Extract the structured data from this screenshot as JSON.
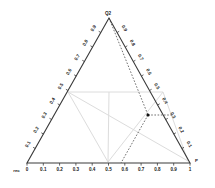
{
  "chart_data": {
    "type": "scatter",
    "plot_kind": "ternary-diagram",
    "title": "",
    "vertices": [
      {
        "id": "top",
        "label": "Q2",
        "x": 109,
        "y": 18
      },
      {
        "id": "left",
        "label": "rec",
        "x": 27,
        "y": 163
      },
      {
        "id": "right",
        "label": "P",
        "x": 190,
        "y": 163
      }
    ],
    "axes": {
      "bottom": {
        "name": "bottom-axis",
        "ticks": [
          "0",
          "0.1",
          "0.2",
          "0.3",
          "0.4",
          "0.5",
          "0.6",
          "0.7",
          "0.8",
          "0.9",
          "1"
        ],
        "label_rotation": 0,
        "range": [
          0,
          1
        ]
      },
      "left": {
        "name": "left-axis",
        "ticks": [
          "0.1",
          "0.2",
          "0.3",
          "0.4",
          "0.5",
          "0.6",
          "0.7",
          "0.8",
          "0.9"
        ],
        "label_rotation": -60,
        "range": [
          0,
          1
        ]
      },
      "right": {
        "name": "right-axis",
        "ticks": [
          "0.9",
          "0.8",
          "0.7",
          "0.6",
          "0.5",
          "0.4",
          "0.3",
          "0.2",
          "0.1"
        ],
        "label_rotation": 60,
        "range": [
          0,
          1
        ]
      }
    },
    "grid": false,
    "legend": null,
    "points": [
      {
        "name": "marked-point",
        "x": 148,
        "y": 115,
        "bottom_value": 0.74,
        "color": "#111111"
      }
    ],
    "guide_lines": [
      {
        "name": "guide-apex-to-point",
        "style": "dashed",
        "color": "#333333",
        "path": [
          [
            109,
            18
          ],
          [
            148,
            115
          ]
        ]
      },
      {
        "name": "guide-point-to-base",
        "style": "dashed",
        "color": "#333333",
        "path": [
          [
            148,
            115
          ],
          [
            121,
            163
          ]
        ]
      },
      {
        "name": "guide-point-to-right-edge",
        "style": "dashed",
        "color": "#333333",
        "path": [
          [
            148,
            115
          ],
          [
            172,
            115
          ]
        ]
      }
    ],
    "region_lines": [
      {
        "name": "region-line-left-to-base",
        "color": "#dcdcdc",
        "path": [
          [
            68,
            92
          ],
          [
            108,
            162
          ]
        ]
      },
      {
        "name": "region-line-left-to-right",
        "color": "#dcdcdc",
        "path": [
          [
            68,
            92
          ],
          [
            163,
            92
          ]
        ]
      },
      {
        "name": "region-line-left-to-lower-right",
        "color": "#dcdcdc",
        "path": [
          [
            68,
            92
          ],
          [
            188,
            161
          ]
        ]
      },
      {
        "name": "region-line-base-to-right",
        "color": "#dcdcdc",
        "path": [
          [
            108,
            162
          ],
          [
            163,
            92
          ]
        ]
      },
      {
        "name": "region-line-base-to-apex",
        "color": "#dcdcdc",
        "path": [
          [
            108,
            162
          ],
          [
            109,
            92
          ]
        ]
      },
      {
        "name": "region-line-right-to-base-lower",
        "color": "#dcdcdc",
        "path": [
          [
            163,
            92
          ],
          [
            188,
            161
          ]
        ]
      }
    ],
    "colors": {
      "outline": "#3a3a3a",
      "tick_text": "#1a1a1a",
      "point": "#111111",
      "dashed_guide": "#333333",
      "region_line": "#dcdcdc",
      "background": "#ffffff"
    }
  }
}
